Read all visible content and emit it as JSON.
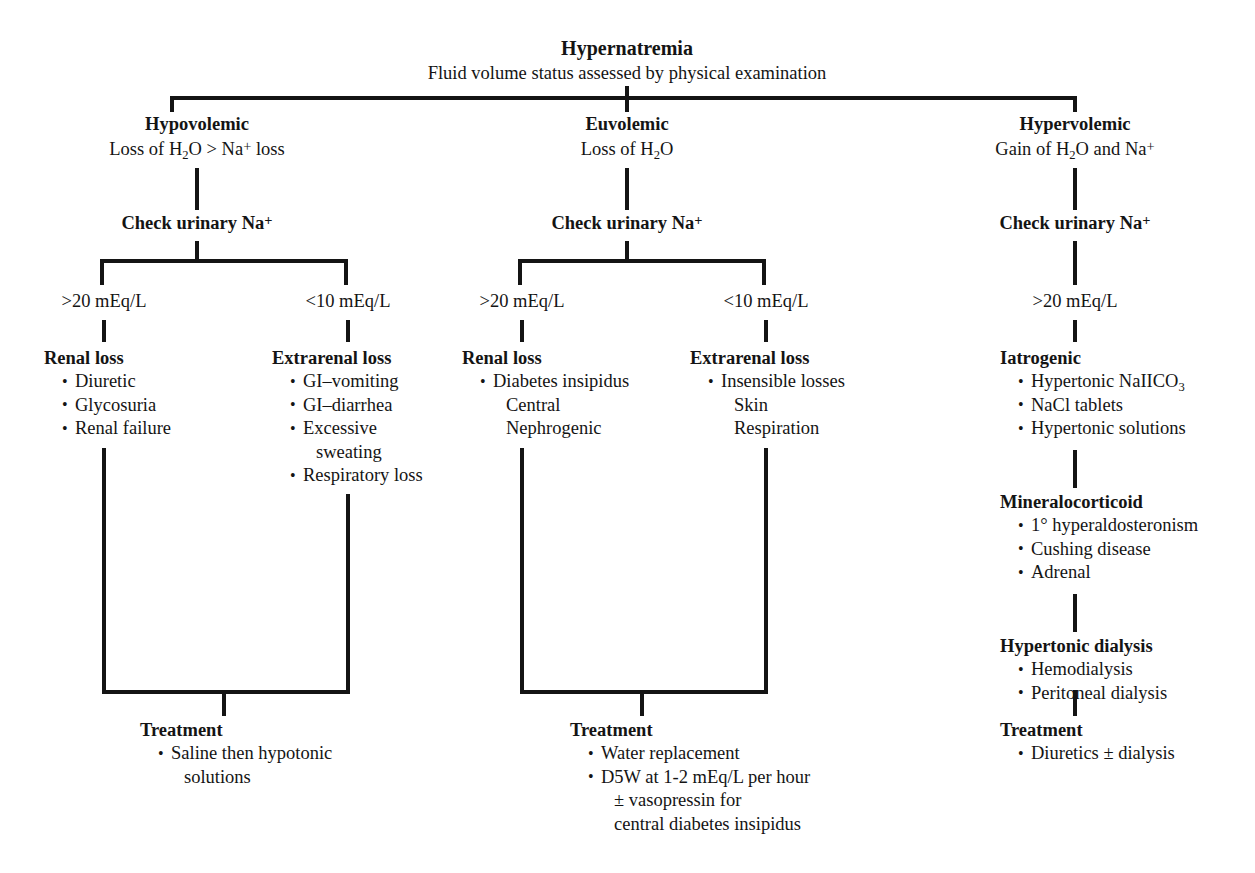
{
  "title": {
    "heading": "Hypernatremia",
    "subheading": "Fluid volume status assessed by physical examination"
  },
  "branches": [
    {
      "id": "hypovolemic",
      "name": "Hypovolemic",
      "definition_pre": "Loss of H",
      "definition_post": "O > Na",
      "definition_tail": " loss",
      "check_label": "Check urinary Na",
      "levels": [
        {
          "label": ">20 mEq/L"
        },
        {
          "label": "<10 mEq/L"
        }
      ],
      "categories": [
        {
          "head": "Renal loss",
          "items": [
            {
              "text": "Diuretic",
              "bullet": true
            },
            {
              "text": "Glycosuria",
              "bullet": true
            },
            {
              "text": "Renal failure",
              "bullet": true
            }
          ]
        },
        {
          "head": "Extrarenal loss",
          "items": [
            {
              "text": "GI–vomiting",
              "bullet": true
            },
            {
              "text": "GI–diarrhea",
              "bullet": true
            },
            {
              "text": "Excessive",
              "bullet": true
            },
            {
              "text": "sweating",
              "bullet": false,
              "sub": true
            },
            {
              "text": "Respiratory loss",
              "bullet": true
            }
          ]
        }
      ],
      "treatment": {
        "head": "Treatment",
        "items": [
          {
            "text": "Saline then hypotonic",
            "bullet": true
          },
          {
            "text": "solutions",
            "bullet": false,
            "sub": true
          }
        ]
      }
    },
    {
      "id": "euvolemic",
      "name": "Euvolemic",
      "definition_pre": "Loss of H",
      "definition_post": "O",
      "definition_tail": "",
      "check_label": "Check urinary Na",
      "levels": [
        {
          "label": ">20 mEq/L"
        },
        {
          "label": "<10 mEq/L"
        }
      ],
      "categories": [
        {
          "head": "Renal loss",
          "items": [
            {
              "text": "Diabetes insipidus",
              "bullet": true
            },
            {
              "text": "Central",
              "bullet": false,
              "sub": true
            },
            {
              "text": "Nephrogenic",
              "bullet": false,
              "sub": true
            }
          ]
        },
        {
          "head": "Extrarenal loss",
          "items": [
            {
              "text": "Insensible losses",
              "bullet": true
            },
            {
              "text": "Skin",
              "bullet": false,
              "sub": true
            },
            {
              "text": "Respiration",
              "bullet": false,
              "sub": true
            }
          ]
        }
      ],
      "treatment": {
        "head": "Treatment",
        "items": [
          {
            "text": "Water replacement",
            "bullet": true
          },
          {
            "text": "D5W at 1-2 mEq/L per hour",
            "bullet": true
          },
          {
            "text": "± vasopressin for",
            "bullet": false,
            "sub": true
          },
          {
            "text": "central diabetes insipidus",
            "bullet": false,
            "sub": true
          }
        ]
      }
    },
    {
      "id": "hypervolemic",
      "name": "Hypervolemic",
      "definition_pre": "Gain of H",
      "definition_post": "O and Na",
      "definition_tail": "",
      "check_label": "Check urinary Na",
      "levels": [
        {
          "label": ">20 mEq/L"
        }
      ],
      "categories": [
        {
          "head": "Iatrogenic",
          "items": [
            {
              "text": "Hypertonic NaIICO",
              "bullet": true,
              "subscript": "3"
            },
            {
              "text": "NaCl tablets",
              "bullet": true
            },
            {
              "text": "Hypertonic solutions",
              "bullet": true
            }
          ]
        },
        {
          "head": "Mineralocorticoid",
          "items": [
            {
              "text": "1° hyperaldosteronism",
              "bullet": true
            },
            {
              "text": "Cushing disease",
              "bullet": true
            },
            {
              "text": "Adrenal",
              "bullet": true
            }
          ]
        },
        {
          "head": "Hypertonic dialysis",
          "items": [
            {
              "text": "Hemodialysis",
              "bullet": true
            },
            {
              "text": "Peritoneal dialysis",
              "bullet": true
            }
          ]
        }
      ],
      "treatment": {
        "head": "Treatment",
        "items": [
          {
            "text": "Diuretics ± dialysis",
            "bullet": true
          }
        ]
      }
    }
  ],
  "symbols": {
    "sodium_charge": "+",
    "water_subscript": "2"
  },
  "colors": {
    "ink": "#141414",
    "background": "#ffffff"
  }
}
